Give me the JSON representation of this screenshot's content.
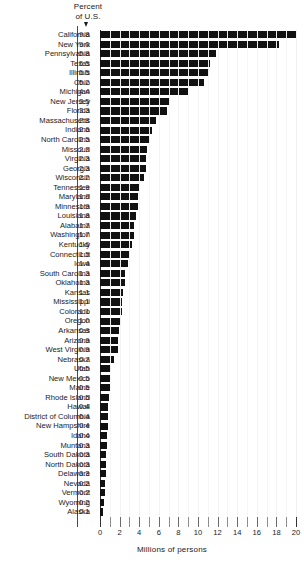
{
  "chart_data": {
    "type": "bar",
    "orientation": "horizontal",
    "title": "",
    "header_label_line1": "Percent",
    "header_label_line2": "of U.S.",
    "value_column_header": "Percent of U.S.",
    "xlabel": "Millions of persons",
    "ylabel": "",
    "xlim": [
      0,
      20
    ],
    "xticks": [
      0,
      2,
      4,
      6,
      8,
      10,
      12,
      14,
      16,
      18,
      20
    ],
    "xtick_labels": [
      "0",
      "2",
      "4",
      "6",
      "8",
      "10",
      "12",
      "14",
      "16",
      "18",
      "20"
    ],
    "minor_tick_step": 1,
    "grid": true,
    "legend": "none",
    "bar_color": "#111111",
    "categories": [
      "California",
      "New York",
      "Pennsylvania",
      "Texas",
      "Illinois",
      "Ohio",
      "Michigan",
      "New Jersey",
      "Florida",
      "Massachusetts",
      "Indiana",
      "North Carolina",
      "Missouri",
      "Virginia",
      "Georgia",
      "Wisconsin",
      "Tennessee",
      "Maryland",
      "Minnesota",
      "Louisiana",
      "Alabama",
      "Washington",
      "Kentucky",
      "Connecticut",
      "Iowa",
      "South Carolina",
      "Oklahoma",
      "Kansas",
      "Mississippi",
      "Colorado",
      "Oregon",
      "Arkansas",
      "Arizona",
      "West Virginia",
      "Nebraska",
      "Utah",
      "New Mexico",
      "Maine",
      "Rhode Island",
      "Hawaii",
      "District of Columbia",
      "New Hampshire",
      "Idaho",
      "Muntana",
      "South Dakota",
      "North Dakota",
      "Delaware",
      "Nevada",
      "Vermont",
      "Wyoming",
      "Alaska"
    ],
    "percent_of_us": [
      "9.8",
      "9.0",
      "5.8",
      "5.5",
      "5.5",
      "5.2",
      "4.4",
      "3.5",
      "3.3",
      "2.8",
      "2.6",
      "2.5",
      "2.3",
      "2.3",
      "2.3",
      "2.2",
      "1.9",
      "1.9",
      "1.9",
      "1.8",
      "1.7",
      "1.7",
      "1.6",
      "1.5",
      "1.4",
      "1.3",
      "1.3",
      "1.1",
      "1.1",
      "1.1",
      "1.0",
      "0.9",
      "0.9",
      "0.9",
      "0.7",
      "0.5",
      "0.5",
      "0.5",
      "0.5",
      "0.4",
      "0.4",
      "0.4",
      "0.4",
      "0.3",
      "0.3",
      "0.3",
      "0.3",
      "0.2",
      "0.2",
      "0.2",
      "0.1"
    ],
    "values_millions": [
      19.95,
      18.25,
      11.8,
      11.2,
      11.1,
      10.65,
      9.0,
      7.15,
      6.8,
      5.7,
      5.3,
      5.1,
      4.8,
      4.7,
      4.65,
      4.45,
      3.95,
      3.9,
      3.85,
      3.7,
      3.5,
      3.45,
      3.25,
      3.05,
      2.85,
      2.6,
      2.6,
      2.3,
      2.25,
      2.2,
      2.1,
      1.9,
      1.85,
      1.8,
      1.45,
      1.1,
      1.05,
      1.0,
      0.95,
      0.85,
      0.8,
      0.8,
      0.75,
      0.7,
      0.65,
      0.62,
      0.58,
      0.5,
      0.48,
      0.45,
      0.3
    ],
    "units": "Millions of persons",
    "row_count": 51
  }
}
